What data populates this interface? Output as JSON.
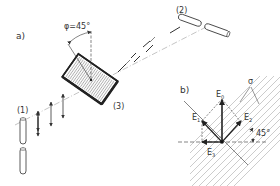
{
  "diagram": {
    "part_a": {
      "label": "a)",
      "angle_label": "φ=45°",
      "antenna_1_label": "(1)",
      "antenna_2_label": "(2)",
      "polarizer_label": "(3)"
    },
    "part_b": {
      "label": "b)",
      "sigma_label": "σ",
      "angle_label": "45°",
      "vectors": {
        "E0": "E",
        "E0_sub": "0",
        "E1": "E",
        "E1_sub": "1",
        "E2": "E",
        "E2_sub": "2",
        "E3": "E",
        "E3_sub": "3"
      }
    }
  },
  "colors": {
    "ink": "#333333",
    "hatch": "#999999",
    "background": "#ffffff"
  }
}
